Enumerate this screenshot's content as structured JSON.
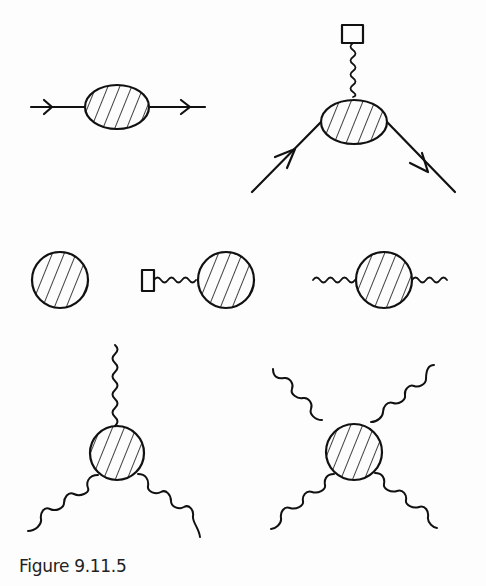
{
  "figure": {
    "caption": "Figure 9.11.5",
    "stroke_color": "#111111",
    "background": "#fdfdfd",
    "diagrams": [
      {
        "id": "fermion-propagator",
        "blob": "ellipse",
        "external_lines": [
          "fermion-in",
          "fermion-out"
        ]
      },
      {
        "id": "vertex-with-external-source",
        "blob": "ellipse",
        "external_lines": [
          "fermion-in",
          "fermion-out",
          "photon-to-source"
        ]
      },
      {
        "id": "vacuum-blob",
        "blob": "circle",
        "external_lines": []
      },
      {
        "id": "tadpole-with-source",
        "blob": "circle",
        "external_lines": [
          "photon-to-source"
        ]
      },
      {
        "id": "photon-self-energy",
        "blob": "circle",
        "external_lines": [
          "photon",
          "photon"
        ]
      },
      {
        "id": "three-photon-vertex",
        "blob": "circle",
        "external_lines": [
          "photon",
          "photon",
          "photon"
        ]
      },
      {
        "id": "four-photon-vertex",
        "blob": "circle",
        "external_lines": [
          "photon",
          "photon",
          "photon",
          "photon"
        ]
      }
    ]
  }
}
